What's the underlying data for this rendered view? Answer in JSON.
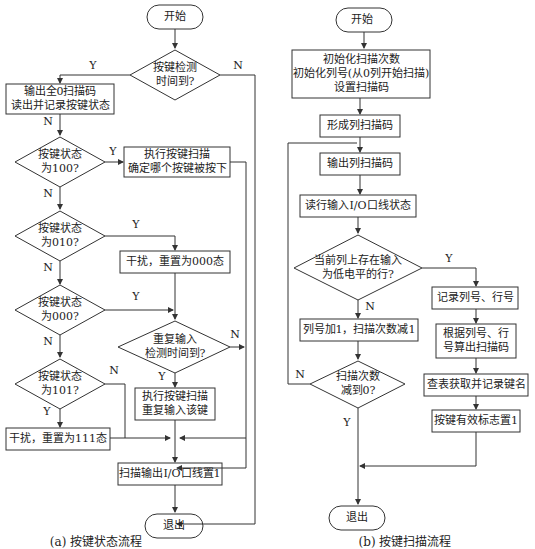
{
  "left": {
    "start": "开始",
    "d_check_time": [
      "按键检测",
      "时间到?"
    ],
    "p_output_zero": [
      "输出全0扫描码",
      "读出并记录按键状态"
    ],
    "d_state_100": [
      "按键状态",
      "为100?"
    ],
    "p_exec_scan": [
      "执行按键扫描",
      "确定哪个按键被按下"
    ],
    "d_state_010": [
      "按键状态",
      "为010?"
    ],
    "p_reset_000": "干扰，重置为000态",
    "d_state_000": [
      "按键状态",
      "为000?"
    ],
    "d_repeat_time": [
      "重复输入",
      "检测时间到?"
    ],
    "d_state_101": [
      "按键状态",
      "为101?"
    ],
    "p_exec_repeat": [
      "执行按键扫描",
      "重复输入该键"
    ],
    "p_reset_111": "干扰，重置为111态",
    "p_output_io": "扫描输出I/O口线置1",
    "end": "退出",
    "caption": "(a) 按键状态流程"
  },
  "right": {
    "start": "开始",
    "p_init": [
      "初始化扫描次数",
      "初始化列号(从0列开始扫描)",
      "设置扫描码"
    ],
    "p_form_code": "形成列扫描码",
    "p_output_code": "输出列扫描码",
    "p_read_row": "读行输入I/O口线状态",
    "d_low_row": [
      "当前列上存在输入",
      "为低电平的行?"
    ],
    "p_record": "记录列号、行号",
    "p_col_inc": "列号加1，扫描次数减1",
    "p_calc_code": [
      "根据列号、行",
      "号算出扫描码"
    ],
    "d_count_zero": [
      "扫描次数",
      "减到0?"
    ],
    "p_lookup": "查表获取并记录键名",
    "p_flag": "按键有效标志置1",
    "end": "退出",
    "caption": "(b) 按键扫描流程"
  },
  "labels": {
    "yes": "Y",
    "no": "N"
  }
}
